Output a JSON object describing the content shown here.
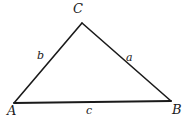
{
  "figure": {
    "type": "geometry-diagram",
    "shape": "triangle",
    "width": 193,
    "height": 126,
    "background_color": "#ffffff",
    "stroke_color": "#1a1a1a",
    "label_color": "#1a1a1a"
  },
  "vertices": {
    "A": {
      "label": "A",
      "x": 14,
      "y": 103
    },
    "B": {
      "label": "B",
      "x": 171,
      "y": 101
    },
    "C": {
      "label": "C",
      "x": 82,
      "y": 23
    }
  },
  "sides": {
    "a": {
      "label": "a",
      "between": "C-B"
    },
    "b": {
      "label": "b",
      "between": "A-C"
    },
    "c": {
      "label": "c",
      "between": "A-B"
    }
  },
  "geometry": {
    "polygon_points": "14,103 82,23 171,101",
    "edge_ac": {
      "x1": 14,
      "y1": 103,
      "x2": 82,
      "y2": 23
    },
    "edge_cb": {
      "x1": 82,
      "y1": 23,
      "x2": 171,
      "y2": 101
    },
    "edge_ab": {
      "x1": 14,
      "y1": 103,
      "x2": 171,
      "y2": 101
    },
    "stroke_width_sides": 1.6,
    "stroke_width_base": 1.8
  }
}
